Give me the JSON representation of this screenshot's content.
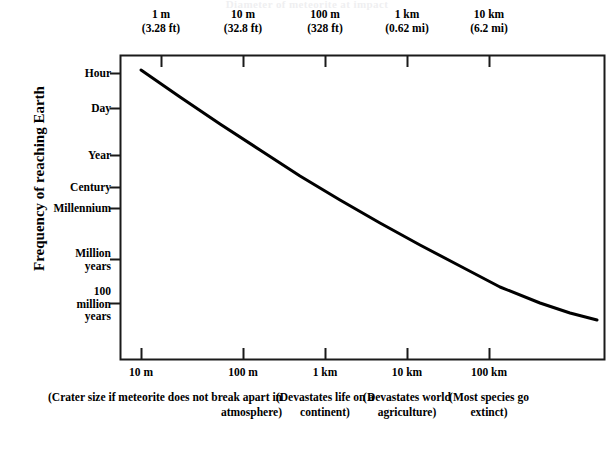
{
  "chart_data": {
    "type": "line",
    "title": "Diameter of meteorite at impact",
    "ylabel": "Frequency of reaching Earth",
    "xlabel_top": "Diameter of meteorite",
    "xlabel_bottom": "Crater size",
    "grid": false,
    "legend": "none",
    "top_axis": {
      "ticks": [
        {
          "primary": "1 m",
          "secondary": "(3.28 ft)",
          "x_px": 161
        },
        {
          "primary": "10 m",
          "secondary": "(32.8 ft)",
          "x_px": 243
        },
        {
          "primary": "100 m",
          "secondary": "(328 ft)",
          "x_px": 325
        },
        {
          "primary": "1 km",
          "secondary": "(0.62 mi)",
          "x_px": 407
        },
        {
          "primary": "10 km",
          "secondary": "(6.2 mi)",
          "x_px": 489
        }
      ]
    },
    "bottom_axis": {
      "ticks": [
        {
          "label": "10 m",
          "x_px": 141,
          "note": ""
        },
        {
          "label": "100 m",
          "x_px": 243,
          "note": ""
        },
        {
          "label": "1 km",
          "x_px": 325,
          "note": "(Devastates life on a continent)"
        },
        {
          "label": "10 km",
          "x_px": 407,
          "note": "(Devastates world agriculture)"
        },
        {
          "label": "100 km",
          "x_px": 489,
          "note": "(Most species go extinct)"
        }
      ],
      "group_note": "(Crater size if meteorite does not break apart in atmosphere)"
    },
    "y_axis": {
      "ticks": [
        {
          "label": "Hour",
          "lines": [
            "Hour"
          ],
          "y_px": 73
        },
        {
          "label": "Day",
          "lines": [
            "Day"
          ],
          "y_px": 108
        },
        {
          "label": "Year",
          "lines": [
            "Year"
          ],
          "y_px": 155
        },
        {
          "label": "Century",
          "lines": [
            "Century"
          ],
          "y_px": 187
        },
        {
          "label": "Millennium",
          "lines": [
            "Millennium"
          ],
          "y_px": 208
        },
        {
          "label": "Million years",
          "lines": [
            "Million",
            "years"
          ],
          "y_px": 259
        },
        {
          "label": "100 million years",
          "lines": [
            "100",
            "million",
            "years"
          ],
          "y_px": 303
        }
      ]
    },
    "series": [
      {
        "name": "Impact frequency vs meteorite diameter",
        "points": [
          {
            "x_px": 141,
            "y_px": 70
          },
          {
            "x_px": 180,
            "y_px": 97
          },
          {
            "x_px": 220,
            "y_px": 124
          },
          {
            "x_px": 260,
            "y_px": 150
          },
          {
            "x_px": 300,
            "y_px": 176
          },
          {
            "x_px": 340,
            "y_px": 200
          },
          {
            "x_px": 380,
            "y_px": 223
          },
          {
            "x_px": 420,
            "y_px": 245
          },
          {
            "x_px": 460,
            "y_px": 266
          },
          {
            "x_px": 500,
            "y_px": 287
          },
          {
            "x_px": 540,
            "y_px": 303
          },
          {
            "x_px": 570,
            "y_px": 313
          },
          {
            "x_px": 597,
            "y_px": 320
          }
        ]
      }
    ],
    "colors": {
      "curve": "#000000",
      "frame": "#1a1a1a",
      "background": "#ffffff",
      "text": "#000000"
    }
  },
  "frame": {
    "left_px": 120,
    "right_px": 604,
    "top_px": 55,
    "bottom_px": 360
  }
}
